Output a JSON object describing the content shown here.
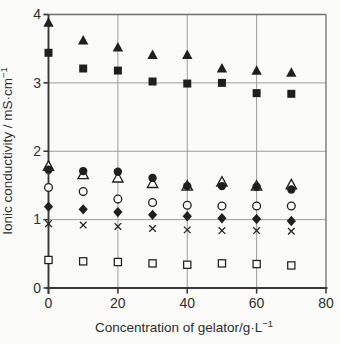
{
  "chart_data": {
    "type": "scatter",
    "title": "",
    "xlabel": "Concentration of gelator/g·L⁻¹",
    "ylabel": "Ionic conductivity / mS·cm⁻¹",
    "xlabel_parts": {
      "main": "Concentration of gelator/g·L",
      "sup": "−1"
    },
    "ylabel_parts": {
      "main": "Ionic conductivity / mS·cm",
      "sup": "−1"
    },
    "xlim": [
      0,
      80
    ],
    "ylim": [
      0,
      4
    ],
    "x_ticks": [
      0,
      20,
      40,
      60,
      80
    ],
    "y_ticks": [
      0,
      1,
      2,
      3,
      4
    ],
    "grid": {
      "x": [
        20,
        40,
        60
      ],
      "y": [
        1,
        2,
        3
      ]
    },
    "frame": {
      "top_y": 4,
      "right_x": 80
    },
    "legend": "none",
    "x": [
      0,
      10,
      20,
      30,
      40,
      50,
      60,
      70
    ],
    "series": [
      {
        "name": "filled-triangle",
        "marker": "triangle",
        "fill": "filled",
        "values": [
          3.88,
          3.62,
          3.52,
          3.41,
          3.41,
          3.21,
          3.18,
          3.15
        ]
      },
      {
        "name": "filled-square",
        "marker": "square",
        "fill": "filled",
        "values": [
          3.44,
          3.21,
          3.18,
          3.02,
          2.99,
          3.0,
          2.85,
          2.84
        ]
      },
      {
        "name": "open-triangle",
        "marker": "triangle",
        "fill": "open",
        "values": [
          1.78,
          1.66,
          1.61,
          1.53,
          1.49,
          1.55,
          1.49,
          1.51
        ]
      },
      {
        "name": "filled-circle",
        "marker": "circle",
        "fill": "filled",
        "values": [
          1.73,
          1.71,
          1.7,
          1.61,
          1.49,
          1.49,
          1.48,
          1.44
        ]
      },
      {
        "name": "open-circle",
        "marker": "circle",
        "fill": "open",
        "values": [
          1.47,
          1.41,
          1.3,
          1.25,
          1.21,
          1.2,
          1.2,
          1.2
        ]
      },
      {
        "name": "filled-diamond",
        "marker": "diamond",
        "fill": "filled",
        "values": [
          1.19,
          1.15,
          1.11,
          1.07,
          1.05,
          1.02,
          1.01,
          0.98
        ]
      },
      {
        "name": "cross",
        "marker": "cross",
        "fill": "line",
        "values": [
          0.94,
          0.92,
          0.9,
          0.87,
          0.85,
          0.84,
          0.84,
          0.83
        ]
      },
      {
        "name": "open-square",
        "marker": "square",
        "fill": "open",
        "values": [
          0.41,
          0.39,
          0.38,
          0.36,
          0.34,
          0.36,
          0.35,
          0.33
        ]
      }
    ],
    "colors": {
      "marker": "#1f1f1f",
      "open_fill": "#fbfbf9",
      "grid": "#9c9c9c",
      "frame": "#6e6e6e",
      "axis": "#383838",
      "text": "#2e2e2e",
      "background": "#fbfbf9"
    }
  }
}
